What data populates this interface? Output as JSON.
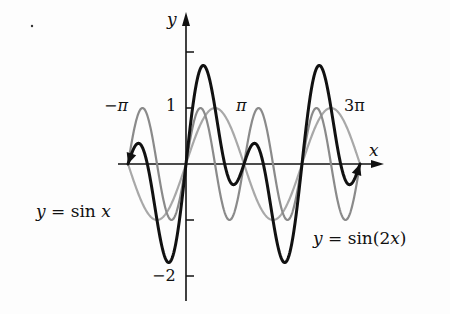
{
  "chart_data": {
    "type": "line",
    "title": "",
    "xlabel": "x",
    "ylabel": "y",
    "xlim": [
      -3.14159,
      9.42478
    ],
    "ylim": [
      -2,
      2
    ],
    "grid": false,
    "legend_position": "inline annotations",
    "x_tick_labels": [
      "-π",
      "π",
      "3π"
    ],
    "x_tick_values": [
      -3.14159,
      3.14159,
      9.42478
    ],
    "y_tick_labels": [
      "1",
      "-2"
    ],
    "y_tick_values": [
      1,
      2,
      -1,
      -2
    ],
    "series": [
      {
        "name": "y = sin x",
        "expr": "sin(x)",
        "color": "#a8a8a8",
        "width": 2.2,
        "annotated": true
      },
      {
        "name": "y = sin(2x)",
        "expr": "sin(2x)",
        "color": "#8a8a8a",
        "width": 2.2,
        "annotated": true
      },
      {
        "name": "y = sin x + sin(2x)",
        "expr": "sin(x)+sin(2x)",
        "color": "#111111",
        "width": 3,
        "annotated": false
      }
    ],
    "sample_points": {
      "x": [
        -3.14,
        -2.36,
        -1.57,
        -0.94,
        0,
        0.94,
        1.57,
        2.36,
        3.14,
        4.19,
        5.34,
        7.22,
        9.42
      ],
      "sin_x": [
        0,
        -0.71,
        -1,
        -0.81,
        0,
        0.81,
        1,
        0.71,
        0,
        -0.87,
        -0.81,
        0.81,
        0
      ],
      "sin_2x": [
        0,
        1,
        0,
        -0.95,
        0,
        0.95,
        0,
        -1,
        0,
        0.87,
        -0.95,
        0.95,
        0
      ],
      "sum": [
        0,
        0.29,
        -1,
        -1.76,
        0,
        1.76,
        1,
        -0.29,
        0,
        0,
        -1.76,
        1.76,
        0
      ]
    }
  },
  "labels": {
    "y_axis": "y",
    "x_axis": "x",
    "neg_pi": "−π",
    "pi": "π",
    "three_pi": "3π",
    "one": "1",
    "neg_two": "−2",
    "sin_x_prefix": "y = sin ",
    "sin_x_var": "x",
    "sin_2x_prefix": "y = sin(2",
    "sin_2x_var": "x",
    "sin_2x_suffix": ")"
  }
}
